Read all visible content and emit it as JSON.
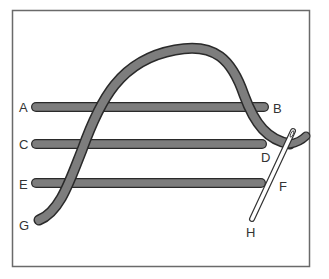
{
  "diagram": {
    "type": "embroidery-stitch-illustration",
    "colors": {
      "thread": "#7d7d7d",
      "thread_outline": "#2a2a2a",
      "needle_fill": "#ffffff",
      "needle_outline": "#333333",
      "frame": "#6a6a6a",
      "label": "#333333"
    },
    "labels": {
      "a": "A",
      "b": "B",
      "c": "C",
      "d": "D",
      "e": "E",
      "f": "F",
      "g": "G",
      "h": "H"
    },
    "stitches": [
      {
        "from": "A",
        "to": "B"
      },
      {
        "from": "C",
        "to": "D"
      },
      {
        "from": "E",
        "to": "F"
      }
    ],
    "working_thread": {
      "from": "G",
      "to": "D"
    },
    "needle": {
      "entry": "D",
      "exit": "H"
    }
  }
}
